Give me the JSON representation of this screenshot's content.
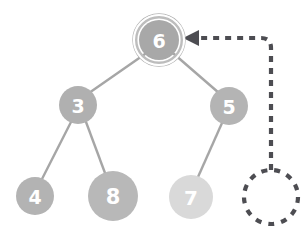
{
  "diagram": {
    "background_color": "#ffffff",
    "edge_color": "#a6a6a6",
    "edge_width": 2.4,
    "pointer_color": "#4d4d52",
    "highlight_ring_color": "#ffffff",
    "highlight_ring_outer_color": "#b3b3b3",
    "label_color": "#ffffff"
  },
  "nodes": [
    {
      "id": "n6",
      "label": "6",
      "cx": 159,
      "cy": 40,
      "r": 20,
      "fill": "#a8a8a8",
      "font_size": 19,
      "highlighted": true,
      "ring_gap": 3.5,
      "ring_width": 2.6,
      "role": "root"
    },
    {
      "id": "n3",
      "label": "3",
      "cx": 78,
      "cy": 105,
      "r": 19,
      "fill": "#b0b0b0",
      "font_size": 19,
      "highlighted": false,
      "role": "left-child"
    },
    {
      "id": "n5",
      "label": "5",
      "cx": 229,
      "cy": 106,
      "r": 19,
      "fill": "#b4b4b4",
      "font_size": 19,
      "highlighted": false,
      "role": "right-child"
    },
    {
      "id": "n4",
      "label": "4",
      "cx": 35,
      "cy": 196,
      "r": 19,
      "fill": "#b3b3b3",
      "font_size": 19,
      "highlighted": false,
      "role": "leaf"
    },
    {
      "id": "n8",
      "label": "8",
      "cx": 113,
      "cy": 196,
      "r": 25,
      "fill": "#b8b8b8",
      "font_size": 21,
      "highlighted": false,
      "role": "leaf"
    },
    {
      "id": "n7",
      "label": "7",
      "cx": 191,
      "cy": 197,
      "r": 22,
      "fill": "#d9d9d9",
      "font_size": 20,
      "highlighted": false,
      "role": "leaf-faded"
    }
  ],
  "edges": [
    {
      "id": "e6-3",
      "from": "n6",
      "to": "n3",
      "x1": 145,
      "y1": 54,
      "x2": 89,
      "y2": 93
    },
    {
      "id": "e6-5",
      "from": "n6",
      "to": "n5",
      "x1": 174,
      "y1": 54,
      "x2": 219,
      "y2": 93
    },
    {
      "id": "e3-4",
      "from": "n3",
      "to": "n4",
      "x1": 71,
      "y1": 122,
      "x2": 42,
      "y2": 179
    },
    {
      "id": "e3-8",
      "from": "n3",
      "to": "n8",
      "x1": 86,
      "y1": 122,
      "x2": 105,
      "y2": 173
    },
    {
      "id": "e5-7",
      "from": "n5",
      "to": "n7",
      "x1": 222,
      "y1": 123,
      "x2": 198,
      "y2": 177
    }
  ],
  "pointer": {
    "id": "return-pointer",
    "style": "dashed",
    "dash_pattern": "6 6",
    "stroke_width": 4.2,
    "color": "#4d4d52",
    "path": "M 271 170 L 271 48 Q 271 38 261 38 L 190 38",
    "arrowhead": {
      "id": "pointer-arrowhead",
      "points": "183,38 199,30 199,46",
      "color": "#4d4d52"
    }
  },
  "placeholder_node": {
    "id": "null-placeholder",
    "cx": 271,
    "cy": 197,
    "r": 27,
    "style": "dashed",
    "dash_pattern": "6 7",
    "stroke_width": 4.2,
    "color": "#4d4d52",
    "fill": "none",
    "label": ""
  }
}
